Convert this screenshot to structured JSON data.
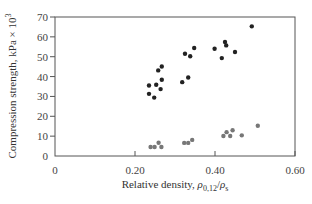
{
  "chart_data": {
    "type": "scatter",
    "title": "",
    "xlabel": "Relative density, ρ0,12/ρs",
    "ylabel": "Compression strength, kPa × 10³",
    "xlim": [
      0,
      0.6
    ],
    "ylim": [
      0,
      70
    ],
    "x_ticks": [
      0,
      0.2,
      0.4,
      0.6
    ],
    "x_tick_labels": [
      "0",
      "0.20",
      "0.40",
      "0.60"
    ],
    "y_ticks": [
      0,
      10,
      20,
      30,
      40,
      50,
      60,
      70
    ],
    "y_tick_labels": [
      "0",
      "10",
      "20",
      "30",
      "40",
      "50",
      "60",
      "70"
    ],
    "grid": false,
    "legend": null,
    "series": [
      {
        "name": "upper group (black)",
        "color": "#222222",
        "points": [
          [
            0.267,
            45.1
          ],
          [
            0.258,
            43.1
          ],
          [
            0.267,
            38.4
          ],
          [
            0.253,
            35.9
          ],
          [
            0.235,
            35.5
          ],
          [
            0.264,
            33.7
          ],
          [
            0.235,
            31.3
          ],
          [
            0.248,
            29.4
          ],
          [
            0.348,
            54.4
          ],
          [
            0.325,
            51.5
          ],
          [
            0.338,
            50.2
          ],
          [
            0.333,
            39.5
          ],
          [
            0.318,
            37.2
          ],
          [
            0.492,
            65.3
          ],
          [
            0.425,
            57.4
          ],
          [
            0.428,
            55.7
          ],
          [
            0.399,
            54.0
          ],
          [
            0.45,
            52.4
          ],
          [
            0.417,
            49.3
          ]
        ]
      },
      {
        "name": "lower group (gray)",
        "color": "#777777",
        "points": [
          [
            0.239,
            4.5
          ],
          [
            0.249,
            4.5
          ],
          [
            0.259,
            6.7
          ],
          [
            0.266,
            4.5
          ],
          [
            0.323,
            6.6
          ],
          [
            0.333,
            6.6
          ],
          [
            0.343,
            8.1
          ],
          [
            0.421,
            10.1
          ],
          [
            0.429,
            12.0
          ],
          [
            0.438,
            10.1
          ],
          [
            0.444,
            13.0
          ],
          [
            0.467,
            10.4
          ],
          [
            0.507,
            15.2
          ]
        ]
      }
    ]
  },
  "labels": {
    "ylabel_main": "Compression strength, kPa × 10",
    "ylabel_sup": "3",
    "xlabel_main": "Relative density, ",
    "xlabel_rho1": "ρ",
    "xlabel_sub1": "0,12",
    "xlabel_slash": "/",
    "xlabel_rho2": "ρ",
    "xlabel_sub2": "s"
  }
}
